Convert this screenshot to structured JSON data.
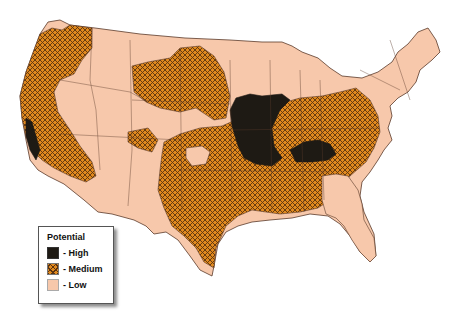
{
  "map": {
    "subject": "Contiguous United States",
    "colors": {
      "high": "#1e1a14",
      "medium": "#e0891e",
      "medium_hatch": "#5a3310",
      "low": "#f7c8ab",
      "border": "#5a3a2a",
      "background": "#ffffff"
    }
  },
  "legend": {
    "title": "Potential",
    "items": [
      {
        "key": "high",
        "label": "- High"
      },
      {
        "key": "medium",
        "label": "- Medium"
      },
      {
        "key": "low",
        "label": "- Low"
      }
    ]
  }
}
